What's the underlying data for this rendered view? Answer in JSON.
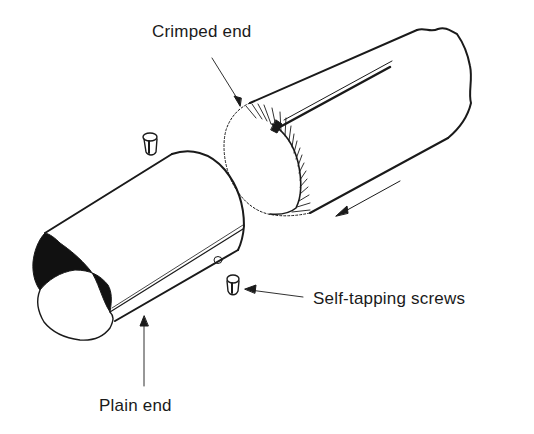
{
  "diagram": {
    "labels": {
      "crimped_end": "Crimped end",
      "self_tapping_screws": "Self-tapping screws",
      "plain_end": "Plain end"
    },
    "parts": [
      {
        "id": "crimped-pipe",
        "label": "Crimped end"
      },
      {
        "id": "plain-pipe",
        "label": "Plain end"
      },
      {
        "id": "screw-top",
        "label": "Self-tapping screws"
      },
      {
        "id": "screw-side",
        "label": "Self-tapping screws"
      }
    ],
    "arrows": [
      {
        "id": "assembly-direction-arrow",
        "meaning": "crimped pipe slides into plain pipe"
      }
    ],
    "colors": {
      "line": "#1a1a1a",
      "background": "#ffffff",
      "shadow_fill": "#111111"
    }
  }
}
